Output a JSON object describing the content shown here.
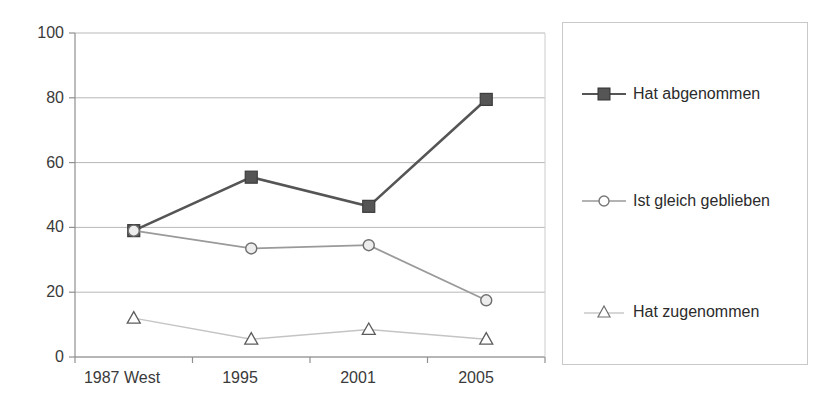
{
  "chart_data": {
    "type": "line",
    "title": "",
    "subtitle": "",
    "xlabel": "",
    "ylabel": "",
    "categories": [
      "1987 West",
      "1995",
      "2001",
      "2005"
    ],
    "ylim": [
      0,
      100
    ],
    "yticks": [
      0,
      20,
      40,
      60,
      80,
      100
    ],
    "grid": "horizontal",
    "legend_position": "right",
    "series": [
      {
        "name": "Hat abgenommen",
        "values": [
          39,
          55.5,
          46.5,
          79.5
        ],
        "color": "#555555",
        "marker": "square-filled"
      },
      {
        "name": "Ist gleich geblieben",
        "values": [
          39,
          33.5,
          34.5,
          17.5
        ],
        "color": "#9a9a9a",
        "marker": "circle-open"
      },
      {
        "name": "Hat zugenommen",
        "values": [
          12,
          5.5,
          8.5,
          5.5
        ],
        "color": "#c4c4c4",
        "marker": "triangle-open"
      }
    ]
  },
  "axis": {
    "y_tick_labels": [
      "100",
      "80",
      "60",
      "40",
      "20",
      "0"
    ],
    "x_tick_labels": [
      "1987 West",
      "1995",
      "2001",
      "2005"
    ]
  },
  "legend": {
    "items": [
      {
        "label": "Hat abgenommen",
        "marker": "square-filled",
        "color": "#555555"
      },
      {
        "label": "Ist gleich geblieben",
        "marker": "circle-open",
        "color": "#9a9a9a"
      },
      {
        "label": "Hat zugenommen",
        "marker": "triangle-open",
        "color": "#c4c4c4"
      }
    ]
  }
}
